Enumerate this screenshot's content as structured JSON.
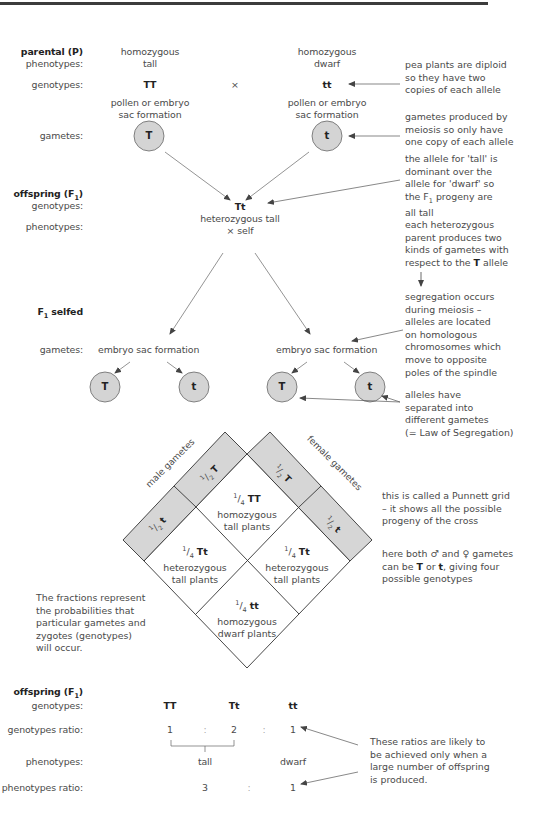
{
  "parental": {
    "heading": "parental (P)",
    "phenotypes_label": "phenotypes:",
    "genotypes_label": "genotypes:",
    "left_phenotype_line1": "homozygous",
    "left_phenotype_line2": "tall",
    "right_phenotype_line1": "homozygous",
    "right_phenotype_line2": "dwarf",
    "left_genotype": "TT",
    "cross_symbol": "×",
    "right_genotype": "tt",
    "left_formation_line1": "pollen or embryo",
    "left_formation_line2": "sac formation",
    "right_formation_line1": "pollen or embryo",
    "right_formation_line2": "sac formation",
    "gametes_label": "gametes:",
    "left_gamete": "T",
    "right_gamete": "t"
  },
  "f1": {
    "heading": "offspring (F",
    "heading_sub": "1",
    "heading_end": ")",
    "genotypes_label": "genotypes:",
    "phenotypes_label": "phenotypes:",
    "genotype": "Tt",
    "phenotype_line1": "heterozygous tall",
    "phenotype_line2": "× self"
  },
  "f1_selfed": {
    "heading": "F",
    "heading_sub": "1",
    "heading_end": " selfed",
    "gametes_label": "gametes:",
    "left_formation": "embryo sac formation",
    "right_formation": "embryo sac formation",
    "gametes": [
      "T",
      "t",
      "T",
      "t"
    ]
  },
  "notes": {
    "diploid": [
      "pea plants are diploid",
      "so they have two",
      "copies of each allele"
    ],
    "meiosis": [
      "gametes produced by",
      "meiosis so only have",
      "one copy of each allele"
    ],
    "dominant": [
      "the allele for 'tall' is",
      "dominant over the",
      "allele for 'dwarf' so",
      "the F",
      "1",
      " progeny are",
      "all tall"
    ],
    "two_kinds": [
      "each heterozygous",
      "parent produces two",
      "kinds of gametes with",
      "respect to the ",
      "T",
      " allele"
    ],
    "segregation": [
      "segregation occurs",
      "during meiosis –",
      "alleles are located",
      "on homologous",
      "chromosomes which",
      "move to opposite",
      "poles of the spindle"
    ],
    "separated": [
      "alleles have",
      "separated into",
      "different gametes",
      "(= Law of Segregation)"
    ],
    "punnett": [
      "this is called a Punnett grid",
      "– it shows all the possible",
      "progeny of the cross"
    ],
    "both_gametes": [
      "here both ♂ and ♀ gametes",
      "can be ",
      "T",
      " or ",
      "t",
      ", giving four",
      "possible genotypes"
    ],
    "fractions": [
      "The fractions represent",
      "the probabilities that",
      "particular gametes and",
      "zygotes (genotypes)",
      "will occur."
    ],
    "ratios": [
      "These ratios are likely to",
      "be achieved only when a",
      "large number of offspring",
      "is produced."
    ]
  },
  "punnett_grid": {
    "male_label": "male gametes",
    "female_label": "female gametes",
    "male_gametes": [
      {
        "frac_num": "1",
        "frac_den": "2",
        "allele": "T"
      },
      {
        "frac_num": "1",
        "frac_den": "2",
        "allele": "t"
      }
    ],
    "female_gametes": [
      {
        "frac_num": "1",
        "frac_den": "2",
        "allele": "T"
      },
      {
        "frac_num": "1",
        "frac_den": "2",
        "allele": "t"
      }
    ],
    "cells": [
      {
        "frac_num": "1",
        "frac_den": "4",
        "genotype": "TT",
        "line1": "homozygous",
        "line2": "tall plants"
      },
      {
        "frac_num": "1",
        "frac_den": "4",
        "genotype": "Tt",
        "line1": "heterozygous",
        "line2": "tall plants"
      },
      {
        "frac_num": "1",
        "frac_den": "4",
        "genotype": "Tt",
        "line1": "heterozygous",
        "line2": "tall plants"
      },
      {
        "frac_num": "1",
        "frac_den": "4",
        "genotype": "tt",
        "line1": "homozygous",
        "line2": "dwarf plants"
      }
    ],
    "band_color": "#d6d6d6"
  },
  "f2": {
    "heading": "offspring (F",
    "heading_sub": "1",
    "heading_end": ")",
    "genotypes_label": "genotypes:",
    "genotype_ratio_label": "genotypes ratio:",
    "phenotypes_label": "phenotypes:",
    "phenotype_ratio_label": "phenotypes ratio:",
    "genotypes": [
      "TT",
      "Tt",
      "tt"
    ],
    "genotype_ratio": [
      "1",
      ":",
      "2",
      ":",
      "1"
    ],
    "phenotypes": [
      "tall",
      "dwarf"
    ],
    "phenotype_ratio": [
      "3",
      ":",
      "1"
    ]
  },
  "colors": {
    "gamete_fill": "#d4d4d4",
    "line": "#555555",
    "rule": "#3c3c3c"
  }
}
